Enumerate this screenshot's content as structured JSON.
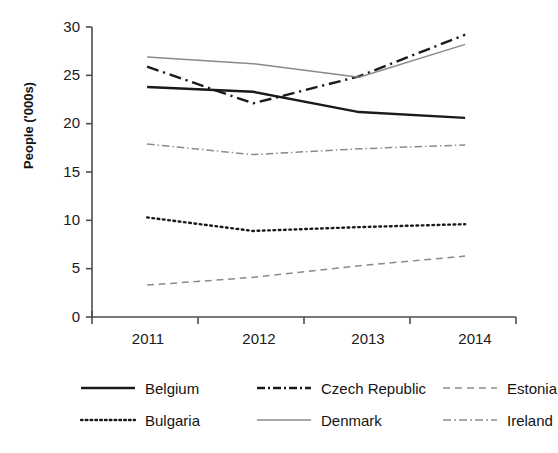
{
  "chart_data": {
    "type": "line",
    "title": "",
    "xlabel": "",
    "ylabel": "People ('000s)",
    "categories": [
      "2011",
      "2012",
      "2013",
      "2014"
    ],
    "ylim": [
      0,
      30
    ],
    "yticks": [
      0,
      5,
      10,
      15,
      20,
      25,
      30
    ],
    "grid": false,
    "legend_position": "bottom",
    "series": [
      {
        "name": "Belgium",
        "values": [
          23.8,
          23.3,
          21.2,
          20.6
        ],
        "style": "solid",
        "color": "#1a1a1a",
        "width": 2.4
      },
      {
        "name": "Bulgaria",
        "values": [
          10.3,
          8.9,
          9.3,
          9.6
        ],
        "style": "dotted",
        "color": "#1a1a1a",
        "width": 2.4
      },
      {
        "name": "Czech Republic",
        "values": [
          25.9,
          22.1,
          24.9,
          29.2
        ],
        "style": "dashdot",
        "color": "#1a1a1a",
        "width": 2.4
      },
      {
        "name": "Denmark",
        "values": [
          26.9,
          26.2,
          24.8,
          28.2
        ],
        "style": "solid",
        "color": "#8a8a8a",
        "width": 1.5
      },
      {
        "name": "Estonia",
        "values": [
          3.3,
          4.1,
          5.3,
          6.3
        ],
        "style": "dashed",
        "color": "#8a8a8a",
        "width": 1.5
      },
      {
        "name": "Ireland",
        "values": [
          17.9,
          16.8,
          17.4,
          17.8
        ],
        "style": "dashdot",
        "color": "#8a8a8a",
        "width": 1.5
      }
    ]
  },
  "axis": {
    "y_label": "People ('000s)",
    "y_ticks": [
      "30",
      "25",
      "20",
      "15",
      "10",
      "5",
      "0"
    ],
    "x_ticks": [
      "2011",
      "2012",
      "2013",
      "2014"
    ]
  },
  "legend": {
    "row1": [
      {
        "label": "Belgium",
        "swatch": "line-solid-black"
      },
      {
        "label": "Czech Republic",
        "swatch": "line-dashdot-black"
      },
      {
        "label": "Estonia",
        "swatch": "line-dashed-gray"
      }
    ],
    "row2": [
      {
        "label": "Bulgaria",
        "swatch": "line-dotted-black"
      },
      {
        "label": "Denmark",
        "swatch": "line-solid-gray"
      },
      {
        "label": "Ireland",
        "swatch": "line-dashdot-gray"
      }
    ]
  },
  "colors": {
    "black": "#1a1a1a",
    "gray": "#8a8a8a",
    "axis": "#4d4d4d",
    "background": "#ffffff"
  }
}
